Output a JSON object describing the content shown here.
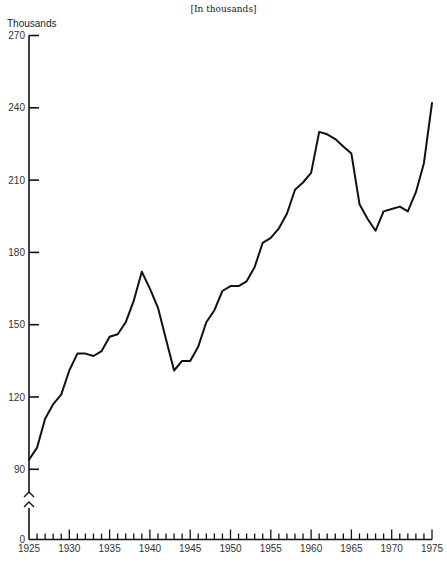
{
  "chart_data": {
    "type": "line",
    "title": "",
    "subtitle": "[In thousands]",
    "xlabel": "",
    "ylabel": "Thousands",
    "xlim": [
      1925,
      1975
    ],
    "ylim": [
      90,
      270
    ],
    "y_axis_break": true,
    "y_ticks": [
      0,
      90,
      120,
      150,
      180,
      210,
      240,
      270
    ],
    "x_ticks": [
      1925,
      1930,
      1935,
      1940,
      1945,
      1950,
      1955,
      1960,
      1965,
      1970,
      1975
    ],
    "x_minor_tick_step": 1,
    "grid": false,
    "legend": null,
    "series": [
      {
        "name": "Value (thousands)",
        "x": [
          1925,
          1926,
          1927,
          1928,
          1929,
          1930,
          1931,
          1932,
          1933,
          1934,
          1935,
          1936,
          1937,
          1938,
          1939,
          1940,
          1941,
          1942,
          1943,
          1944,
          1945,
          1946,
          1947,
          1948,
          1949,
          1950,
          1951,
          1952,
          1953,
          1954,
          1955,
          1956,
          1957,
          1958,
          1959,
          1960,
          1961,
          1962,
          1963,
          1964,
          1965,
          1966,
          1967,
          1968,
          1969,
          1970,
          1971,
          1972,
          1973,
          1974,
          1975
        ],
        "values": [
          94,
          99,
          111,
          117,
          121,
          131,
          138,
          138,
          137,
          139,
          145,
          146,
          151,
          160,
          172,
          165,
          157,
          144,
          131,
          135,
          135,
          141,
          151,
          156,
          164,
          166,
          166,
          168,
          174,
          184,
          186,
          190,
          196,
          206,
          209,
          213,
          230,
          229,
          227,
          224,
          221,
          200,
          194,
          189,
          197,
          198,
          199,
          197,
          205,
          217,
          242
        ]
      }
    ]
  },
  "labels": {
    "subtitle": "[In thousands]",
    "y_unit": "Thousands"
  }
}
